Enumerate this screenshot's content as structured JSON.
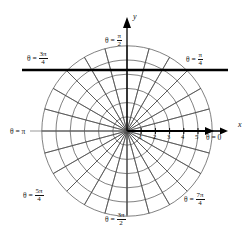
{
  "figure": {
    "kind": "polar-coordinate-grid",
    "center_px": [
      127,
      131
    ],
    "unit_px": 14.2,
    "circles": [
      1,
      2,
      3,
      4,
      5,
      6
    ],
    "radial_lines_deg": [
      0,
      15,
      30,
      45,
      60,
      75,
      90,
      105,
      120,
      135,
      150,
      165,
      180,
      195,
      210,
      225,
      240,
      255,
      270,
      285,
      300,
      315,
      330,
      345
    ],
    "colors": {
      "grid": "#4a4a4a",
      "axis": "#000000",
      "emphasis_line": "#000000",
      "background": "#ffffff",
      "text": "#111111"
    }
  },
  "axes": {
    "y_label": "y",
    "x_label": "x",
    "x_ticks": [
      "1",
      "2",
      "3",
      "4",
      "5"
    ]
  },
  "angle_labels": {
    "theta0": {
      "theta": "θ",
      "eq": "=",
      "value": "0",
      "deg": 0
    },
    "pi_over_4": {
      "theta": "θ",
      "eq": "=",
      "num": "π",
      "den": "4",
      "deg": 45
    },
    "pi_over_2": {
      "theta": "θ",
      "eq": "=",
      "num": "π",
      "den": "2",
      "deg": 90
    },
    "three_pi_over_4": {
      "theta": "θ",
      "eq": "=",
      "num": "3π",
      "den": "4",
      "deg": 135
    },
    "pi": {
      "theta": "θ",
      "eq": "=",
      "value": "π",
      "deg": 180
    },
    "five_pi_over_4": {
      "theta": "θ",
      "eq": "=",
      "num": "5π",
      "den": "4",
      "deg": 225
    },
    "three_pi_over_2": {
      "theta": "θ",
      "eq": "=",
      "num": "3π",
      "den": "2",
      "deg": 270
    },
    "seven_pi_over_4": {
      "theta": "θ",
      "eq": "=",
      "num": "7π",
      "den": "4",
      "deg": 315
    }
  },
  "emphasis_line": {
    "name": "horizontal-rule",
    "y_px": 70,
    "x_start_px": 22,
    "x_end_px": 228
  }
}
